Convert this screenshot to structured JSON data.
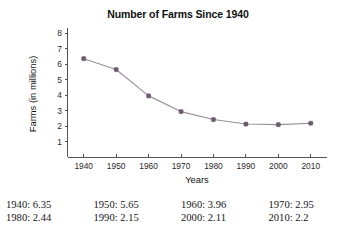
{
  "chart_data": {
    "type": "line",
    "title": "Number of Farms Since 1940",
    "xlabel": "Years",
    "ylabel": "Farms (in millions)",
    "x": [
      1940,
      1950,
      1960,
      1970,
      1980,
      1990,
      2000,
      2010
    ],
    "values": [
      6.35,
      5.65,
      3.96,
      2.95,
      2.44,
      2.15,
      2.11,
      2.2
    ],
    "xtick_labels": [
      "1940",
      "1950",
      "1960",
      "1970",
      "1980",
      "1990",
      "2000",
      "2010"
    ],
    "ytick_labels": [
      "1",
      "2",
      "3",
      "4",
      "5",
      "6",
      "7",
      "8"
    ],
    "yticks": [
      1,
      2,
      3,
      4,
      5,
      6,
      7,
      8
    ],
    "xlim": [
      1935,
      2015
    ],
    "ylim": [
      0,
      8
    ],
    "grid": false,
    "legend": false,
    "line_color": "#9b8f9b",
    "marker_color": "#6e5c6e",
    "axis_color": "#555555"
  },
  "data_table": {
    "rows": [
      [
        "1940: 6.35",
        "1950: 5.65",
        "1960: 3.96",
        "1970: 2.95"
      ],
      [
        "1980: 2.44",
        "1990: 2.15",
        "2000: 2.11",
        "2010: 2.2"
      ]
    ]
  }
}
